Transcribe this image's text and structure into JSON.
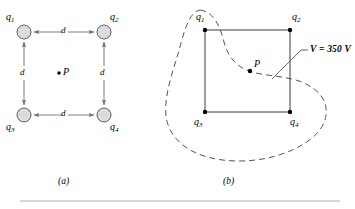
{
  "figure": {
    "panels": [
      {
        "id": "a",
        "caption": "(a)",
        "description": "Square array of four charges with point P at center",
        "charges": [
          {
            "name": "q1",
            "label_main": "q",
            "label_sub": "1",
            "x": 24,
            "y": 32
          },
          {
            "name": "q2",
            "label_main": "q",
            "label_sub": "2",
            "x": 104,
            "y": 32
          },
          {
            "name": "q3",
            "label_main": "q",
            "label_sub": "3",
            "x": 24,
            "y": 115
          },
          {
            "name": "q4",
            "label_main": "q",
            "label_sub": "4",
            "x": 104,
            "y": 115
          }
        ],
        "distance_labels": [
          {
            "text": "d",
            "x": 61,
            "y": 28
          },
          {
            "text": "d",
            "x": 61,
            "y": 111
          },
          {
            "text": "d",
            "x": 20,
            "y": 72
          },
          {
            "text": "d",
            "x": 100,
            "y": 72
          }
        ],
        "point": {
          "label": "P",
          "x": 62,
          "y": 73
        },
        "circle_fill": "#dcdcdc",
        "circle_stroke": "#5a5a5a",
        "arrow_color": "#6e6e6e"
      },
      {
        "id": "b",
        "caption": "(b)",
        "description": "Same square with dashed equipotential surface through P",
        "charges": [
          {
            "name": "q1",
            "label_main": "q",
            "label_sub": "1",
            "x": 205,
            "y": 30
          },
          {
            "name": "q2",
            "label_main": "q",
            "label_sub": "2",
            "x": 290,
            "y": 30
          },
          {
            "name": "q3",
            "label_main": "q",
            "label_sub": "3",
            "x": 205,
            "y": 112
          },
          {
            "name": "q4",
            "label_main": "q",
            "label_sub": "4",
            "x": 290,
            "y": 112
          }
        ],
        "point": {
          "label": "P",
          "x": 250,
          "y": 70
        },
        "equipotential": {
          "label": "V = 350 V",
          "value": 350,
          "unit": "V",
          "quantity": "V",
          "line_color": "#555555",
          "style": "dashed"
        }
      }
    ],
    "colors": {
      "ink": "#000000",
      "dash": "#555555",
      "square_edge": "#3a3a3a",
      "rule": "#b0b0b0"
    }
  }
}
